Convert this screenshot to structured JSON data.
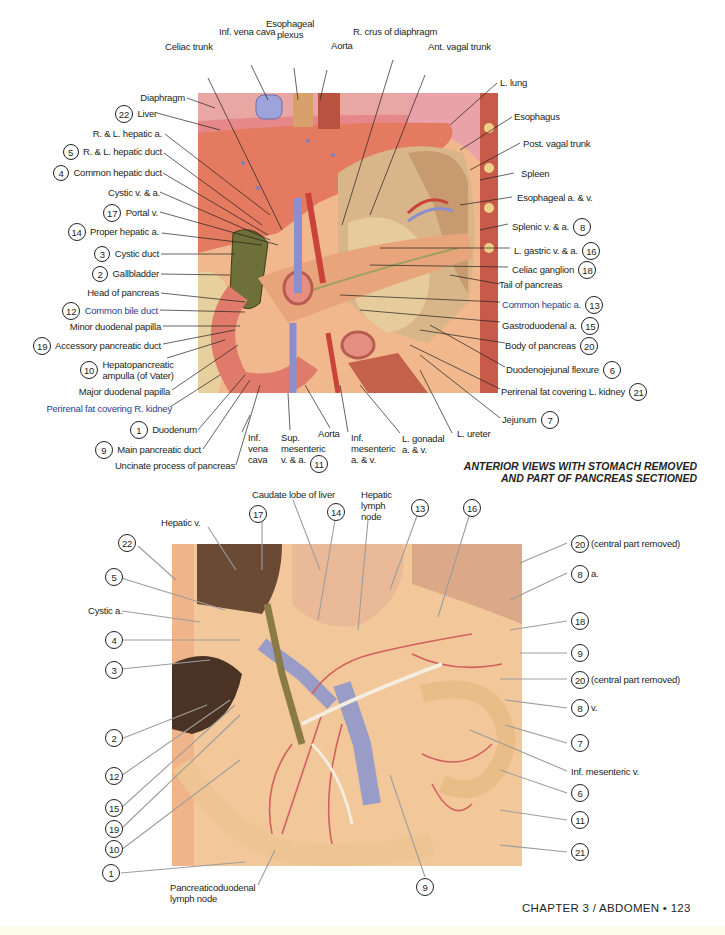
{
  "page": {
    "caption": [
      "ANTERIOR VIEWS WITH STOMACH REMOVED",
      "AND PART OF PANCREAS SECTIONED"
    ],
    "footer": "CHAPTER 3 / ABDOMEN • 123",
    "colors": {
      "text": "#231f20",
      "blue_label": "#2b3f8f",
      "liver": "#e47a5f",
      "pancreas": "#e8a57c",
      "vein": "#8b8fd0",
      "artery": "#c9433b",
      "specimen_bg": "#f2c79a"
    }
  },
  "top_figure": {
    "labels_top": [
      {
        "id": "inf-vena-cava",
        "text": "Inf. vena cava"
      },
      {
        "id": "esophageal-plexus",
        "text": "Esophageal\nplexus"
      },
      {
        "id": "aorta",
        "text": "Aorta"
      },
      {
        "id": "r-crus-of-diaphragm",
        "text": "R. crus of diaphragm"
      },
      {
        "id": "celiac-trunk",
        "text": "Celiac trunk"
      },
      {
        "id": "ant-vagal-trunk",
        "text": "Ant. vagal trunk"
      },
      {
        "id": "l-lung",
        "text": "L. lung"
      }
    ],
    "labels_left": [
      {
        "num": "",
        "text": "Diaphragm"
      },
      {
        "num": "22",
        "text": "Liver"
      },
      {
        "num": "",
        "text": "R. & L. hepatic a."
      },
      {
        "num": "5",
        "text": "R. & L. hepatic duct"
      },
      {
        "num": "4",
        "text": "Common hepatic duct"
      },
      {
        "num": "",
        "text": "Cystic v. & a."
      },
      {
        "num": "17",
        "text": "Portal v."
      },
      {
        "num": "14",
        "text": "Proper hepatic a."
      },
      {
        "num": "3",
        "text": "Cystic duct"
      },
      {
        "num": "2",
        "text": "Gallbladder"
      },
      {
        "num": "",
        "text": "Head of pancreas"
      },
      {
        "num": "12",
        "text": "Common bile duct"
      },
      {
        "num": "",
        "text": "Minor duodenal papilla"
      },
      {
        "num": "19",
        "text": "Accessory pancreatic duct"
      },
      {
        "num": "10",
        "text": "Hepatopancreatic\nampulla (of Vater)"
      },
      {
        "num": "",
        "text": "Major duodenal papilla"
      },
      {
        "num": "",
        "text": "Perirenal fat covering R. kidney"
      },
      {
        "num": "1",
        "text": "Duodenum"
      },
      {
        "num": "9",
        "text": "Main pancreatic duct"
      },
      {
        "num": "",
        "text": "Uncinate process of pancreas"
      }
    ],
    "labels_right": [
      {
        "num": "",
        "text": "Esophagus"
      },
      {
        "num": "",
        "text": "Post. vagal trunk"
      },
      {
        "num": "",
        "text": "Spleen"
      },
      {
        "num": "",
        "text": "Esophageal a. & v."
      },
      {
        "num": "8",
        "text": "Splenic v. & a."
      },
      {
        "num": "16",
        "text": "L. gastric v. & a."
      },
      {
        "num": "18",
        "text": "Celiac ganglion"
      },
      {
        "num": "",
        "text": "Tail of pancreas"
      },
      {
        "num": "13",
        "text": "Common hepatic a."
      },
      {
        "num": "15",
        "text": "Gastroduodenal a."
      },
      {
        "num": "20",
        "text": "Body of pancreas"
      },
      {
        "num": "6",
        "text": "Duodenojejunal flexure"
      },
      {
        "num": "21",
        "text": "Perirenal fat covering L. kidney"
      },
      {
        "num": "7",
        "text": "Jejunum"
      }
    ],
    "labels_bottom": [
      {
        "num": "",
        "text": "Inf.\nvena\ncava"
      },
      {
        "num": "11",
        "text": "Sup.\nmesenteric\nv. & a."
      },
      {
        "num": "",
        "text": "Aorta"
      },
      {
        "num": "",
        "text": "Inf.\nmesenteric\na. & v."
      },
      {
        "num": "",
        "text": "L. gonadal\na. & v."
      },
      {
        "num": "",
        "text": "L. ureter"
      }
    ]
  },
  "bottom_figure": {
    "labels_top": [
      {
        "num": "",
        "text": "Hepatic v."
      },
      {
        "num": "17",
        "text": ""
      },
      {
        "num": "",
        "text": "Caudate lobe of liver"
      },
      {
        "num": "14",
        "text": ""
      },
      {
        "num": "",
        "text": "Hepatic\nlymph\nnode"
      },
      {
        "num": "13",
        "text": ""
      },
      {
        "num": "16",
        "text": ""
      }
    ],
    "labels_left": [
      {
        "num": "22",
        "text": ""
      },
      {
        "num": "5",
        "text": ""
      },
      {
        "num": "",
        "text": "Cystic a."
      },
      {
        "num": "4",
        "text": ""
      },
      {
        "num": "3",
        "text": ""
      },
      {
        "num": "2",
        "text": ""
      },
      {
        "num": "12",
        "text": ""
      },
      {
        "num": "15",
        "text": ""
      },
      {
        "num": "19",
        "text": ""
      },
      {
        "num": "10",
        "text": ""
      },
      {
        "num": "1",
        "text": ""
      }
    ],
    "labels_right": [
      {
        "num": "20",
        "text": "(central part removed)"
      },
      {
        "num": "8",
        "text": "a."
      },
      {
        "num": "18",
        "text": ""
      },
      {
        "num": "9",
        "text": ""
      },
      {
        "num": "20",
        "text": "(central part removed)"
      },
      {
        "num": "8",
        "text": "v."
      },
      {
        "num": "7",
        "text": ""
      },
      {
        "num": "",
        "text": "Inf. mesenteric v."
      },
      {
        "num": "6",
        "text": ""
      },
      {
        "num": "11",
        "text": ""
      },
      {
        "num": "21",
        "text": ""
      }
    ],
    "labels_bottom": [
      {
        "num": "",
        "text": "Pancreaticoduodenal\nlymph node"
      },
      {
        "num": "9",
        "text": ""
      }
    ]
  }
}
